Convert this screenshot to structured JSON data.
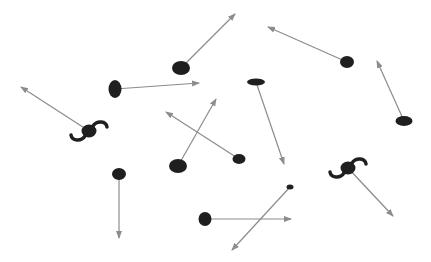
{
  "diagram": {
    "width": 431,
    "height": 262,
    "background": "#ffffff",
    "ball_color": "#1f1f1f",
    "arrow_color": "#8c8c8c",
    "objects": [
      {
        "id": "ball-1",
        "shape": "ellipse",
        "cx": 181,
        "cy": 68,
        "rx": 9,
        "ry": 7,
        "arrow_to": [
          235,
          14
        ]
      },
      {
        "id": "ball-2",
        "shape": "ellipse",
        "cx": 115,
        "cy": 89,
        "rx": 6.5,
        "ry": 9,
        "arrow_to": [
          199,
          83
        ]
      },
      {
        "id": "ball-3",
        "shape": "ellipse",
        "cx": 347,
        "cy": 62,
        "rx": 7,
        "ry": 6,
        "arrow_to": [
          268,
          27
        ]
      },
      {
        "id": "ball-4",
        "shape": "ellipse",
        "cx": 404,
        "cy": 121,
        "rx": 8.5,
        "ry": 5,
        "arrow_to": [
          377,
          61
        ]
      },
      {
        "id": "ball-5",
        "shape": "ellipse",
        "cx": 256,
        "cy": 82,
        "rx": 9,
        "ry": 3.5,
        "arrow_to": [
          284,
          164
        ]
      },
      {
        "id": "ball-6",
        "shape": "ellipse",
        "cx": 178,
        "cy": 166,
        "rx": 9,
        "ry": 7,
        "arrow_to": [
          216,
          99
        ]
      },
      {
        "id": "ball-7",
        "shape": "ellipse",
        "cx": 239,
        "cy": 159,
        "rx": 6.5,
        "ry": 5,
        "arrow_to": [
          166,
          112
        ]
      },
      {
        "id": "ball-8",
        "shape": "ellipse",
        "cx": 205,
        "cy": 219,
        "rx": 6.5,
        "ry": 7,
        "arrow_to": [
          291,
          219
        ]
      },
      {
        "id": "ball-9",
        "shape": "ellipse",
        "cx": 290,
        "cy": 187,
        "rx": 3.5,
        "ry": 2.5,
        "arrow_to": [
          232,
          250
        ]
      },
      {
        "id": "ball-10",
        "shape": "ellipse",
        "cx": 119,
        "cy": 174,
        "rx": 7,
        "ry": 6,
        "arrow_to": [
          119,
          238
        ]
      },
      {
        "id": "spinner-1",
        "shape": "spinner",
        "cx": 89,
        "cy": 131,
        "rx": 7.5,
        "ry": 6.5,
        "arrow_to": [
          21,
          87
        ]
      },
      {
        "id": "spinner-2",
        "shape": "spinner",
        "cx": 348,
        "cy": 168,
        "rx": 7.5,
        "ry": 6.5,
        "arrow_to": [
          393,
          216
        ]
      }
    ]
  }
}
